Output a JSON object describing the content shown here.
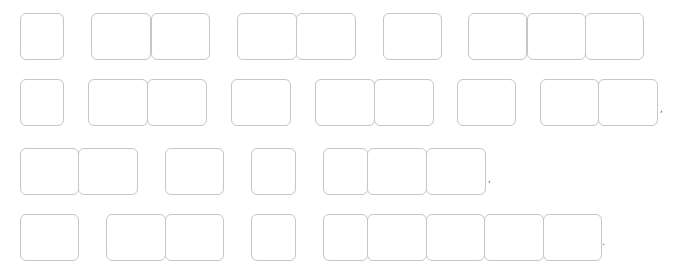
{
  "canvas": {
    "width": 678,
    "height": 248,
    "background": "#ffffff",
    "border_color": "#c6c6c6"
  },
  "rows": [
    {
      "y": 13,
      "h": 47,
      "boxes": [
        {
          "x": 20,
          "w": 44
        },
        {
          "x": 91,
          "w": 60
        },
        {
          "x": 151,
          "w": 59
        },
        {
          "x": 237,
          "w": 60
        },
        {
          "x": 296,
          "w": 60
        },
        {
          "x": 383,
          "w": 59
        },
        {
          "x": 468,
          "w": 59
        },
        {
          "x": 527,
          "w": 59
        },
        {
          "x": 585,
          "w": 59
        }
      ]
    },
    {
      "y": 79,
      "h": 47,
      "boxes": [
        {
          "x": 20,
          "w": 44
        },
        {
          "x": 88,
          "w": 60
        },
        {
          "x": 147,
          "w": 60
        },
        {
          "x": 231,
          "w": 60
        },
        {
          "x": 315,
          "w": 60
        },
        {
          "x": 374,
          "w": 60
        },
        {
          "x": 457,
          "w": 59
        },
        {
          "x": 540,
          "w": 59
        },
        {
          "x": 598,
          "w": 60
        }
      ]
    },
    {
      "y": 148,
      "h": 47,
      "boxes": [
        {
          "x": 20,
          "w": 59
        },
        {
          "x": 78,
          "w": 60
        },
        {
          "x": 165,
          "w": 59
        },
        {
          "x": 251,
          "w": 45
        },
        {
          "x": 323,
          "w": 45
        },
        {
          "x": 367,
          "w": 60
        },
        {
          "x": 426,
          "w": 60
        }
      ]
    },
    {
      "y": 214,
      "h": 47,
      "boxes": [
        {
          "x": 20,
          "w": 59
        },
        {
          "x": 106,
          "w": 60
        },
        {
          "x": 165,
          "w": 59
        },
        {
          "x": 251,
          "w": 45
        },
        {
          "x": 323,
          "w": 45
        },
        {
          "x": 367,
          "w": 60
        },
        {
          "x": 426,
          "w": 59
        },
        {
          "x": 484,
          "w": 60
        },
        {
          "x": 543,
          "w": 59
        }
      ]
    }
  ],
  "marks": [
    {
      "x": 660,
      "y": 105,
      "text": ","
    },
    {
      "x": 488,
      "y": 175,
      "text": ","
    },
    {
      "x": 602,
      "y": 238,
      "text": "."
    }
  ]
}
